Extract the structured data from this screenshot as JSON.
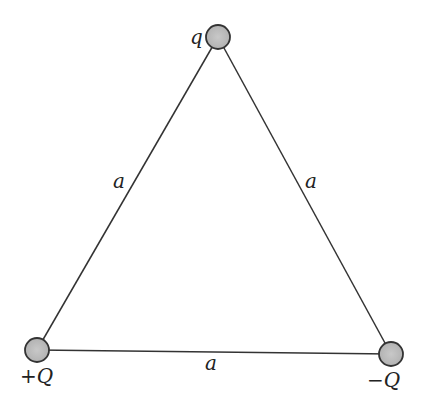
{
  "diagram": {
    "charges": [
      {
        "id": "top",
        "label": "q",
        "x": 218,
        "y": 37
      },
      {
        "id": "bottom-left",
        "label": "+Q",
        "sign": "+",
        "symbol": "Q",
        "x": 37,
        "y": 350
      },
      {
        "id": "bottom-right",
        "label": "−Q",
        "sign": "−",
        "symbol": "Q",
        "x": 391,
        "y": 354
      }
    ],
    "sides": [
      {
        "id": "left",
        "label": "a"
      },
      {
        "id": "right",
        "label": "a"
      },
      {
        "id": "bottom",
        "label": "a"
      }
    ],
    "colors": {
      "line": "#333333",
      "charge_fill": "#bdbdbd",
      "charge_stroke": "#333333"
    }
  }
}
